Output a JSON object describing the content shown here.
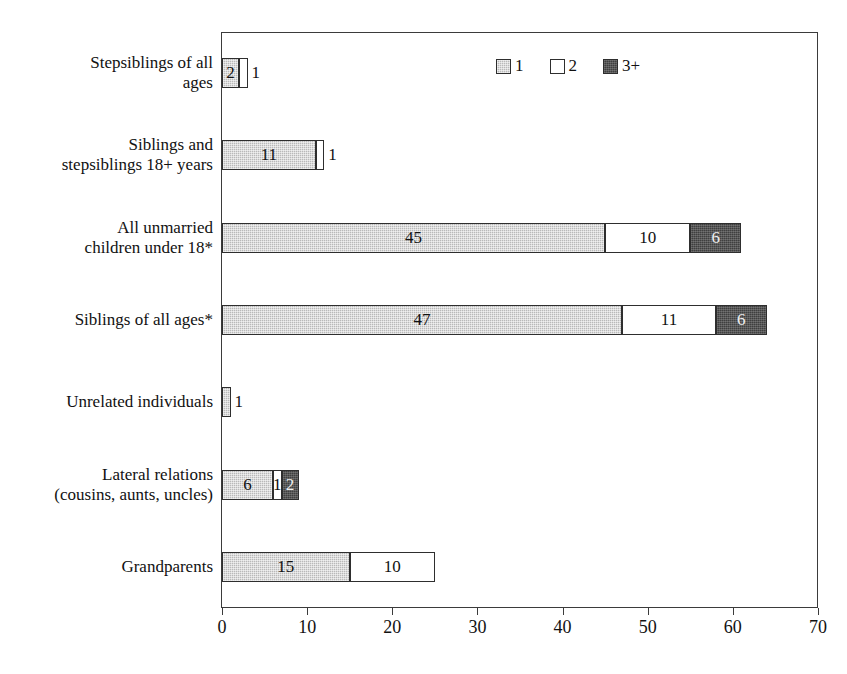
{
  "top_clipped_caption": "",
  "legend": {
    "position": "top-right-inside",
    "items": [
      {
        "label": "1",
        "swatch": "light-gray",
        "color": "#b9b9b9"
      },
      {
        "label": "2",
        "swatch": "white",
        "color": "#ffffff"
      },
      {
        "label": "3+",
        "swatch": "dark-gray",
        "color": "#3f3f3f"
      }
    ]
  },
  "axis": {
    "x_ticks": [
      "0",
      "10",
      "20",
      "30",
      "40",
      "50",
      "60",
      "70"
    ],
    "x_min": 0,
    "x_max": 70,
    "x_step": 10
  },
  "chart_data": {
    "type": "bar",
    "orientation": "horizontal",
    "stacked": true,
    "title": "",
    "subtitle": "",
    "xlabel": "",
    "ylabel": "",
    "xlim": [
      0,
      70
    ],
    "xticks": [
      0,
      10,
      20,
      30,
      40,
      50,
      60,
      70
    ],
    "grid": false,
    "legend_position": "top-right-inside",
    "categories": [
      "Stepsiblings of all ages",
      "Siblings and stepsiblings 18+ years",
      "All unmarried children under 18*",
      "Siblings of all ages*",
      "Unrelated individuals",
      "Lateral relations (cousins, aunts, uncles)",
      "Grandparents"
    ],
    "category_lines": [
      [
        "Stepsiblings of all",
        "ages"
      ],
      [
        "Siblings and",
        "stepsiblings 18+ years"
      ],
      [
        "All unmarried",
        "children under 18*"
      ],
      [
        "Siblings of all ages*"
      ],
      [
        "Unrelated individuals"
      ],
      [
        "Lateral relations",
        "(cousins, aunts, uncles)"
      ],
      [
        "Grandparents"
      ]
    ],
    "series": [
      {
        "name": "1",
        "color": "#b9b9b9",
        "values": [
          2,
          11,
          45,
          47,
          1,
          6,
          15
        ]
      },
      {
        "name": "2",
        "color": "#ffffff",
        "values": [
          1,
          1,
          10,
          11,
          0,
          1,
          10
        ]
      },
      {
        "name": "3+",
        "color": "#3f3f3f",
        "values": [
          0,
          0,
          6,
          6,
          0,
          2,
          0
        ]
      }
    ],
    "totals": [
      3,
      12,
      61,
      64,
      1,
      9,
      25
    ],
    "data_labels": [
      {
        "category": "Stepsiblings of all ages",
        "series": "1",
        "text": "2",
        "placement": "inside"
      },
      {
        "category": "Stepsiblings of all ages",
        "series": "2",
        "text": "1",
        "placement": "outside"
      },
      {
        "category": "Siblings and stepsiblings 18+ years",
        "series": "1",
        "text": "11",
        "placement": "inside"
      },
      {
        "category": "Siblings and stepsiblings 18+ years",
        "series": "2",
        "text": "1",
        "placement": "outside"
      },
      {
        "category": "All unmarried children under 18*",
        "series": "1",
        "text": "45",
        "placement": "inside"
      },
      {
        "category": "All unmarried children under 18*",
        "series": "2",
        "text": "10",
        "placement": "inside"
      },
      {
        "category": "All unmarried children under 18*",
        "series": "3+",
        "text": "6",
        "placement": "inside"
      },
      {
        "category": "Siblings of all ages*",
        "series": "1",
        "text": "47",
        "placement": "inside"
      },
      {
        "category": "Siblings of all ages*",
        "series": "2",
        "text": "11",
        "placement": "inside"
      },
      {
        "category": "Siblings of all ages*",
        "series": "3+",
        "text": "6",
        "placement": "inside"
      },
      {
        "category": "Unrelated individuals",
        "series": "1",
        "text": "1",
        "placement": "outside"
      },
      {
        "category": "Lateral relations (cousins, aunts, uncles)",
        "series": "1",
        "text": "6",
        "placement": "inside"
      },
      {
        "category": "Lateral relations (cousins, aunts, uncles)",
        "series": "2",
        "text": "1",
        "placement": "inside"
      },
      {
        "category": "Lateral relations (cousins, aunts, uncles)",
        "series": "3+",
        "text": "2",
        "placement": "inside"
      },
      {
        "category": "Grandparents",
        "series": "1",
        "text": "15",
        "placement": "inside"
      },
      {
        "category": "Grandparents",
        "series": "2",
        "text": "10",
        "placement": "inside"
      }
    ]
  }
}
